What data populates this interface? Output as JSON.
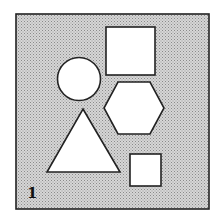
{
  "figure": {
    "panel_label": "1",
    "background_pattern": "stippled-gray",
    "colors": {
      "page": "#ffffff",
      "panel_fill": "#c9c9c9",
      "dot": "#8a8a8a",
      "stroke": "#222222",
      "shape_fill": "#ffffff"
    },
    "frame": {
      "x": 16,
      "y": 14,
      "width": 193,
      "height": 195
    },
    "shapes": [
      {
        "type": "square",
        "name": "large-square",
        "x": 106,
        "y": 27,
        "width": 49,
        "height": 48
      },
      {
        "type": "circle",
        "name": "circle",
        "cx": 79,
        "cy": 79,
        "r": 21.5
      },
      {
        "type": "hexagon",
        "name": "hexagon",
        "points": "118,82 150,82 164,108 150,134 118,134 104,108"
      },
      {
        "type": "triangle",
        "name": "triangle",
        "points": "83,109 120,172 47,172"
      },
      {
        "type": "square",
        "name": "small-square",
        "x": 130,
        "y": 154,
        "width": 31,
        "height": 32
      }
    ]
  }
}
